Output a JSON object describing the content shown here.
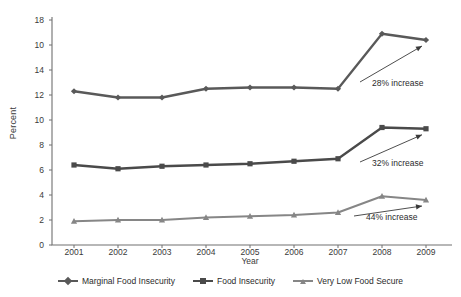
{
  "chart_data": {
    "type": "line",
    "title": "",
    "xlabel": "Year",
    "ylabel": "Percent",
    "categories": [
      "2001",
      "2002",
      "2003",
      "2004",
      "2005",
      "2006",
      "2007",
      "2008",
      "2009"
    ],
    "ylim": [
      0,
      18
    ],
    "yticks": [
      "0",
      "2",
      "4",
      "6",
      "8",
      "10",
      "12",
      "14",
      "10",
      "18"
    ],
    "ytick_values": [
      0,
      2,
      4,
      6,
      8,
      10,
      12,
      14,
      16,
      18
    ],
    "grid": false,
    "legend_position": "bottom",
    "series": [
      {
        "name": "Marginal Food Insecurity",
        "color": "#595959",
        "marker": "diamond",
        "values": [
          12.3,
          11.8,
          11.8,
          12.5,
          12.6,
          12.6,
          12.5,
          16.9,
          16.4
        ]
      },
      {
        "name": "Food Insecurity",
        "color": "#4a4a4a",
        "marker": "square",
        "values": [
          6.4,
          6.1,
          6.3,
          6.4,
          6.5,
          6.7,
          6.9,
          9.4,
          9.3
        ]
      },
      {
        "name": "Very Low Food Secure",
        "color": "#868686",
        "marker": "triangle",
        "values": [
          1.9,
          2.0,
          2.0,
          2.2,
          2.3,
          2.4,
          2.6,
          3.9,
          3.6
        ]
      }
    ],
    "annotations": [
      {
        "text": "28% increase",
        "series": "Marginal Food Insecurity"
      },
      {
        "text": "32% increase",
        "series": "Food Insecurity"
      },
      {
        "text": "44% increase",
        "series": "Very Low Food Secure"
      }
    ]
  },
  "axis": {
    "y_title": "Percent",
    "x_title": "Year"
  },
  "colors": {
    "marginal": "#595959",
    "food_insecurity": "#4a4a4a",
    "very_low": "#868686",
    "axis": "#707070",
    "text": "#2b2b2b",
    "background": "#ffffff"
  }
}
